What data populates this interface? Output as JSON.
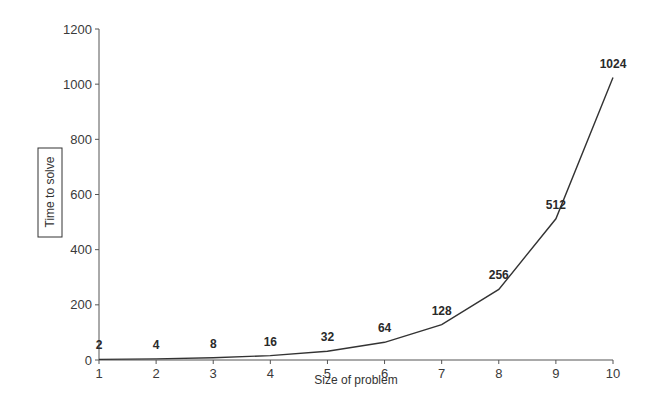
{
  "chart_data": {
    "type": "line",
    "title": "",
    "xlabel": "Size of problem",
    "ylabel": "Time to solve",
    "x": [
      1,
      2,
      3,
      4,
      5,
      6,
      7,
      8,
      9,
      10
    ],
    "series": [
      {
        "name": "Time to solve",
        "values": [
          2,
          4,
          8,
          16,
          32,
          64,
          128,
          256,
          512,
          1024
        ]
      }
    ],
    "data_labels": [
      "2",
      "4",
      "8",
      "16",
      "32",
      "64",
      "128",
      "256",
      "512",
      "1024"
    ],
    "xlim": [
      1,
      10
    ],
    "ylim": [
      0,
      1200
    ],
    "x_ticks": [
      1,
      2,
      3,
      4,
      5,
      6,
      7,
      8,
      9,
      10
    ],
    "y_ticks": [
      0,
      200,
      400,
      600,
      800,
      1000,
      1200
    ],
    "grid": false,
    "legend": "none",
    "line_color": "#333333"
  }
}
